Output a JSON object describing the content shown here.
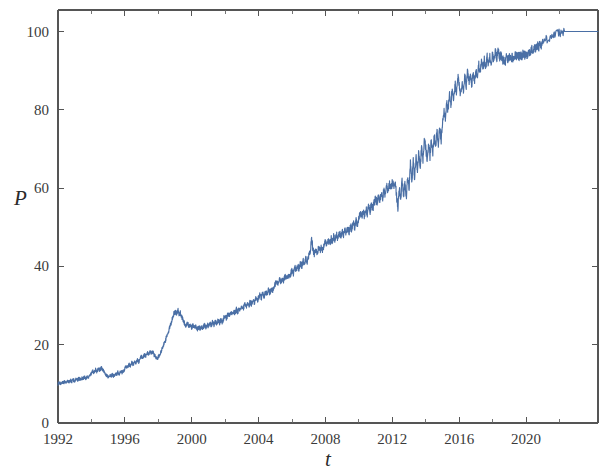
{
  "chart_data": {
    "type": "line",
    "title": "",
    "subtitle": "",
    "xlabel": "t",
    "ylabel": "P",
    "xlim": [
      1992,
      2024.3
    ],
    "ylim": [
      0,
      105.5
    ],
    "grid": false,
    "legend": null,
    "legend_position": "none",
    "x_tick_labels": [
      "1992",
      "1996",
      "2000",
      "2004",
      "2008",
      "2012",
      "2016",
      "2020"
    ],
    "x_ticks": [
      1992,
      1996,
      2000,
      2004,
      2008,
      2012,
      2016,
      2020
    ],
    "y_tick_labels": [
      "0",
      "20",
      "40",
      "60",
      "80",
      "100"
    ],
    "y_ticks": [
      0,
      20,
      40,
      60,
      80,
      100
    ],
    "series": [
      {
        "name": "P",
        "color": "#4a6fa5",
        "x": [
          1992.0,
          1992.08,
          1992.17,
          1992.25,
          1992.33,
          1992.42,
          1992.5,
          1992.58,
          1992.67,
          1992.75,
          1992.83,
          1992.92,
          1993.0,
          1993.08,
          1993.17,
          1993.25,
          1993.33,
          1993.42,
          1993.5,
          1993.58,
          1993.67,
          1993.75,
          1993.83,
          1993.92,
          1994.0,
          1994.08,
          1994.17,
          1994.25,
          1994.33,
          1994.42,
          1994.5,
          1994.58,
          1994.67,
          1994.75,
          1994.83,
          1994.92,
          1995.0,
          1995.08,
          1995.17,
          1995.25,
          1995.33,
          1995.42,
          1995.5,
          1995.58,
          1995.67,
          1995.75,
          1995.83,
          1995.92,
          1996.0,
          1996.08,
          1996.17,
          1996.25,
          1996.33,
          1996.42,
          1996.5,
          1996.58,
          1996.67,
          1996.75,
          1996.83,
          1996.92,
          1997.0,
          1997.08,
          1997.17,
          1997.25,
          1997.33,
          1997.42,
          1997.5,
          1997.58,
          1997.67,
          1997.75,
          1997.83,
          1997.92,
          1998.0,
          1998.08,
          1998.17,
          1998.25,
          1998.33,
          1998.42,
          1998.5,
          1998.58,
          1998.67,
          1998.75,
          1998.83,
          1998.92,
          1999.0,
          1999.08,
          1999.17,
          1999.25,
          1999.33,
          1999.42,
          1999.5,
          1999.58,
          1999.67,
          1999.75,
          1999.83,
          1999.92,
          2000.0,
          2000.08,
          2000.17,
          2000.25,
          2000.33,
          2000.42,
          2000.5,
          2000.58,
          2000.67,
          2000.75,
          2000.83,
          2000.92,
          2001.0,
          2001.08,
          2001.17,
          2001.25,
          2001.33,
          2001.42,
          2001.5,
          2001.58,
          2001.67,
          2001.75,
          2001.83,
          2001.92,
          2002.0,
          2002.08,
          2002.17,
          2002.25,
          2002.33,
          2002.42,
          2002.5,
          2002.58,
          2002.67,
          2002.75,
          2002.83,
          2002.92,
          2003.0,
          2003.08,
          2003.17,
          2003.25,
          2003.33,
          2003.42,
          2003.5,
          2003.58,
          2003.67,
          2003.75,
          2003.83,
          2003.92,
          2004.0,
          2004.08,
          2004.17,
          2004.25,
          2004.33,
          2004.42,
          2004.5,
          2004.58,
          2004.67,
          2004.75,
          2004.83,
          2004.92,
          2005.0,
          2005.08,
          2005.17,
          2005.25,
          2005.33,
          2005.42,
          2005.5,
          2005.58,
          2005.67,
          2005.75,
          2005.83,
          2005.92,
          2006.0,
          2006.08,
          2006.17,
          2006.25,
          2006.33,
          2006.42,
          2006.5,
          2006.58,
          2006.67,
          2006.75,
          2006.83,
          2006.92,
          2007.0,
          2007.08,
          2007.17,
          2007.25,
          2007.33,
          2007.42,
          2007.5,
          2007.58,
          2007.67,
          2007.75,
          2007.83,
          2007.92,
          2008.0,
          2008.08,
          2008.17,
          2008.25,
          2008.33,
          2008.42,
          2008.5,
          2008.58,
          2008.67,
          2008.75,
          2008.83,
          2008.92,
          2009.0,
          2009.08,
          2009.17,
          2009.25,
          2009.33,
          2009.42,
          2009.5,
          2009.58,
          2009.67,
          2009.75,
          2009.83,
          2009.92,
          2010.0,
          2010.08,
          2010.17,
          2010.25,
          2010.33,
          2010.42,
          2010.5,
          2010.58,
          2010.67,
          2010.75,
          2010.83,
          2010.92,
          2011.0,
          2011.08,
          2011.17,
          2011.25,
          2011.33,
          2011.42,
          2011.5,
          2011.58,
          2011.67,
          2011.75,
          2011.83,
          2011.92,
          2012.0,
          2012.08,
          2012.17,
          2012.25,
          2012.33,
          2012.42,
          2012.5,
          2012.58,
          2012.67,
          2012.75,
          2012.83,
          2012.92,
          2013.0,
          2013.08,
          2013.17,
          2013.25,
          2013.33,
          2013.42,
          2013.5,
          2013.58,
          2013.67,
          2013.75,
          2013.83,
          2013.92,
          2014.0,
          2014.08,
          2014.17,
          2014.25,
          2014.33,
          2014.42,
          2014.5,
          2014.58,
          2014.67,
          2014.75,
          2014.83,
          2014.92,
          2015.0,
          2015.08,
          2015.17,
          2015.25,
          2015.33,
          2015.42,
          2015.5,
          2015.58,
          2015.67,
          2015.75,
          2015.83,
          2015.92,
          2016.0,
          2016.08,
          2016.17,
          2016.25,
          2016.33,
          2016.42,
          2016.5,
          2016.58,
          2016.67,
          2016.75,
          2016.83,
          2016.92,
          2017.0,
          2017.08,
          2017.17,
          2017.25,
          2017.33,
          2017.42,
          2017.5,
          2017.58,
          2017.67,
          2017.75,
          2017.83,
          2017.92,
          2018.0,
          2018.08,
          2018.17,
          2018.25,
          2018.33,
          2018.42,
          2018.5,
          2018.58,
          2018.67,
          2018.75,
          2018.83,
          2018.92,
          2019.0,
          2019.08,
          2019.17,
          2019.25,
          2019.33,
          2019.42,
          2019.5,
          2019.58,
          2019.67,
          2019.75,
          2019.83,
          2019.92,
          2020.0,
          2020.08,
          2020.17,
          2020.25,
          2020.33,
          2020.42,
          2020.5,
          2020.58,
          2020.67,
          2020.75,
          2020.83,
          2020.92,
          2021.0,
          2021.2,
          2021.4,
          2021.6,
          2021.8,
          2022.0,
          2022.3,
          2022.6,
          2023.0,
          2023.5,
          2024.0,
          2024.3
        ],
        "y": [
          10.0,
          10.3,
          10.1,
          10.5,
          10.2,
          10.6,
          10.4,
          10.8,
          10.5,
          10.9,
          10.6,
          11.0,
          10.7,
          11.2,
          10.9,
          11.4,
          11.1,
          11.5,
          11.3,
          11.8,
          11.4,
          12.0,
          11.6,
          12.2,
          12.6,
          13.2,
          12.8,
          13.6,
          13.1,
          13.9,
          13.4,
          14.2,
          13.6,
          13.0,
          12.5,
          12.1,
          11.8,
          12.2,
          11.9,
          12.4,
          12.0,
          12.6,
          12.3,
          12.9,
          12.5,
          13.1,
          12.8,
          13.4,
          13.8,
          14.6,
          14.1,
          15.0,
          14.5,
          15.4,
          14.9,
          15.8,
          15.2,
          16.2,
          15.6,
          16.6,
          17.2,
          16.6,
          17.6,
          17.0,
          18.0,
          17.3,
          18.4,
          17.7,
          18.2,
          17.4,
          17.0,
          16.5,
          16.9,
          17.5,
          18.3,
          19.2,
          20.0,
          21.0,
          22.0,
          23.0,
          24.2,
          25.4,
          26.6,
          27.8,
          28.6,
          28.0,
          28.8,
          27.6,
          28.2,
          27.0,
          26.2,
          25.4,
          24.8,
          25.4,
          24.6,
          25.2,
          24.4,
          25.0,
          24.2,
          24.8,
          24.0,
          24.6,
          24.0,
          24.8,
          24.2,
          25.0,
          24.4,
          25.2,
          24.8,
          25.6,
          25.0,
          25.8,
          25.2,
          26.0,
          25.4,
          26.2,
          25.6,
          26.4,
          25.8,
          26.8,
          27.4,
          26.8,
          27.8,
          27.2,
          28.2,
          27.6,
          28.6,
          28.0,
          29.0,
          28.4,
          29.4,
          28.8,
          29.8,
          29.2,
          30.2,
          29.6,
          30.6,
          30.0,
          31.0,
          30.4,
          31.4,
          30.8,
          31.8,
          31.2,
          32.2,
          32.8,
          32.0,
          33.2,
          32.4,
          33.6,
          32.8,
          34.0,
          33.2,
          34.4,
          33.6,
          34.8,
          35.4,
          36.2,
          35.6,
          36.6,
          36.0,
          37.0,
          36.4,
          37.4,
          36.8,
          37.8,
          37.2,
          38.2,
          39.0,
          38.2,
          39.6,
          38.8,
          40.2,
          39.4,
          40.8,
          40.0,
          41.4,
          40.6,
          42.0,
          41.2,
          42.6,
          43.6,
          47.0,
          44.4,
          43.2,
          44.2,
          43.4,
          44.6,
          43.8,
          45.0,
          44.2,
          45.6,
          46.4,
          45.4,
          46.8,
          45.8,
          47.2,
          46.2,
          47.8,
          46.6,
          48.2,
          47.0,
          48.6,
          47.4,
          48.8,
          47.8,
          49.2,
          48.2,
          49.8,
          48.8,
          50.4,
          49.4,
          51.0,
          50.0,
          51.6,
          50.6,
          52.4,
          53.4,
          52.6,
          54.0,
          53.0,
          54.6,
          53.6,
          55.2,
          54.2,
          55.8,
          54.8,
          56.4,
          57.2,
          56.2,
          58.0,
          57.0,
          58.6,
          57.6,
          59.4,
          58.4,
          60.2,
          59.2,
          61.0,
          60.0,
          61.4,
          60.4,
          62.0,
          58.0,
          55.0,
          60.0,
          57.0,
          62.0,
          58.0,
          61.0,
          57.5,
          63.0,
          60.0,
          66.5,
          62.0,
          67.0,
          62.5,
          68.0,
          64.0,
          69.5,
          65.5,
          71.0,
          67.0,
          72.5,
          70.0,
          67.0,
          71.5,
          68.0,
          72.5,
          69.0,
          73.5,
          70.0,
          74.5,
          71.0,
          75.5,
          72.0,
          77.0,
          80.0,
          78.0,
          82.0,
          79.5,
          84.0,
          81.0,
          85.5,
          82.5,
          87.0,
          84.0,
          88.5,
          86.0,
          84.0,
          87.5,
          85.0,
          89.0,
          86.0,
          90.0,
          87.0,
          88.5,
          86.5,
          89.5,
          87.5,
          90.5,
          88.5,
          91.5,
          89.5,
          92.5,
          90.5,
          93.0,
          91.0,
          93.5,
          91.5,
          94.0,
          92.0,
          94.5,
          92.5,
          95.0,
          93.0,
          95.5,
          93.5,
          94.0,
          92.5,
          93.0,
          92.0,
          93.5,
          92.5,
          94.0,
          93.0,
          93.5,
          93.0,
          94.0,
          93.5,
          94.5,
          93.5,
          94.0,
          93.5,
          94.5,
          94.0,
          94.5,
          94.0,
          95.0,
          94.5,
          95.5,
          95.0,
          96.0,
          95.5,
          96.5,
          96.0,
          97.0,
          96.5,
          97.5,
          98.0,
          98.5,
          99.0,
          99.4,
          99.7,
          100.0,
          100.0,
          100.0,
          100.0,
          100.0,
          100.0
        ]
      }
    ]
  }
}
